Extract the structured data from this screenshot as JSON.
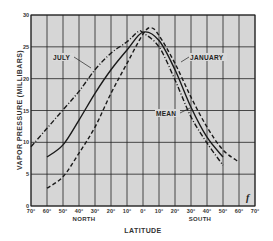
{
  "chart_data": {
    "type": "line",
    "title": "",
    "xlabel": "LATITUDE",
    "ylabel": "VAPOR PRESSURE (MILLIBARS)",
    "x_direction_labels": {
      "north": "NORTH",
      "south": "SOUTH"
    },
    "x_tick_labels": [
      "70°",
      "60°",
      "50°",
      "40°",
      "30°",
      "20°",
      "10°",
      "0°",
      "10°",
      "20°",
      "30°",
      "40°",
      "50°",
      "60°",
      "70°"
    ],
    "x_ticks_signed": [
      70,
      60,
      50,
      40,
      30,
      20,
      10,
      0,
      -10,
      -20,
      -30,
      -40,
      -50,
      -60,
      -70
    ],
    "y_tick_labels": [
      "0",
      "5",
      "10",
      "15",
      "20",
      "25",
      "30"
    ],
    "ylim": [
      0,
      30
    ],
    "xlim": [
      70,
      -70
    ],
    "grid": true,
    "legend": "inline curve labels",
    "series": [
      {
        "name": "JULY",
        "style": "dash-dot",
        "x": [
          70,
          60,
          50,
          40,
          30,
          20,
          10,
          3,
          0,
          -10,
          -20,
          -30,
          -40,
          -50
        ],
        "values": [
          9.3,
          12.2,
          15.1,
          18.0,
          21.4,
          24.0,
          25.8,
          27.4,
          27.2,
          25.0,
          19.8,
          14.0,
          9.9,
          6.4
        ]
      },
      {
        "name": "MEAN",
        "style": "solid",
        "x": [
          60,
          50,
          40,
          30,
          20,
          10,
          0,
          -10,
          -20,
          -30,
          -40,
          -50
        ],
        "values": [
          7.7,
          9.6,
          13.5,
          17.7,
          21.4,
          24.5,
          27.3,
          26.0,
          21.4,
          15.5,
          10.8,
          7.7
        ]
      },
      {
        "name": "JANUARY",
        "style": "dashed",
        "x": [
          60,
          50,
          40,
          30,
          20,
          10,
          0,
          -5,
          -10,
          -20,
          -30,
          -40,
          -50,
          -60
        ],
        "values": [
          2.8,
          4.6,
          8.3,
          12.4,
          17.7,
          22.4,
          27.0,
          28.0,
          26.8,
          22.4,
          17.1,
          12.4,
          8.8,
          6.9
        ]
      }
    ],
    "annotations": [
      {
        "text": "JULY",
        "points_to": "JULY"
      },
      {
        "text": "JANUARY",
        "points_to": "JANUARY"
      },
      {
        "text": "MEAN",
        "points_to": "MEAN"
      },
      {
        "text": "f",
        "position": "lower-right corner"
      }
    ]
  },
  "labels": {
    "julyLabel": "JULY",
    "januaryLabel": "JANUARY",
    "meanLabel": "MEAN",
    "corner_mark": "f"
  },
  "colors": {
    "plot_bg": "#d6d6d6",
    "grid": "#222222",
    "curve": "#1a1a1a",
    "text": "#333333"
  }
}
